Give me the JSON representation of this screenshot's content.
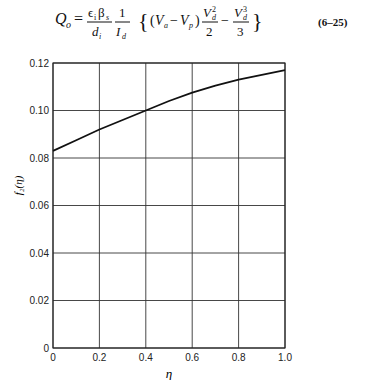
{
  "equation": {
    "text": "Q_o = (ε_i β_s / d_i) (1 / I_d) {(V_a − V_p) V_d²/2 − V_d³/3}",
    "number": "(6–25)"
  },
  "chart_data": {
    "type": "line",
    "title": "",
    "xlabel": "η",
    "ylabel": "f₂(η)",
    "xlim": [
      0,
      1.0
    ],
    "ylim": [
      0,
      0.12
    ],
    "grid": true,
    "x_ticks": [
      "0",
      "0.2",
      "0.4",
      "0.6",
      "0.8",
      "1.0"
    ],
    "y_ticks": [
      "0",
      "0.02",
      "0.04",
      "0.06",
      "0.08",
      "0.10",
      "0.12"
    ],
    "series": [
      {
        "name": "f₂(η)",
        "x": [
          0,
          0.1,
          0.2,
          0.3,
          0.4,
          0.5,
          0.6,
          0.7,
          0.8,
          0.9,
          1.0
        ],
        "values": [
          0.083,
          0.0875,
          0.092,
          0.096,
          0.1,
          0.104,
          0.1075,
          0.1105,
          0.113,
          0.115,
          0.117
        ]
      }
    ]
  }
}
